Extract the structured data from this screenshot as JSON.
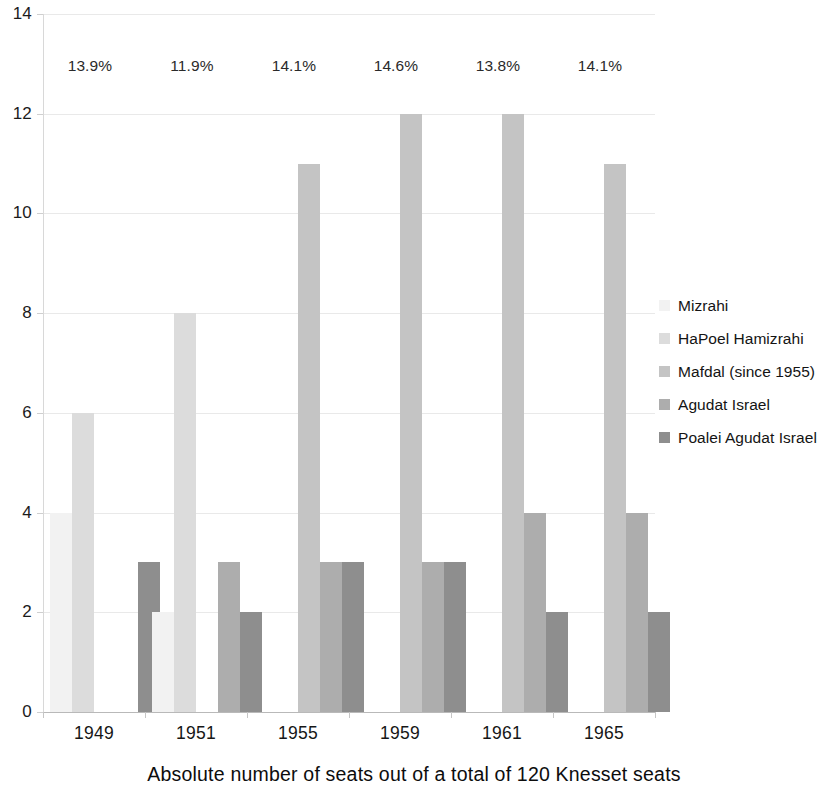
{
  "chart_data": {
    "type": "bar",
    "title": "",
    "subtitle": "",
    "caption": "Absolute number of seats out of a total of 120 Knesset seats",
    "xlabel": "",
    "ylabel": "",
    "ylim": [
      0,
      14
    ],
    "y_ticks": [
      "0",
      "2",
      "4",
      "6",
      "8",
      "10",
      "12",
      "14"
    ],
    "grid": true,
    "legend_position": "right",
    "categories": [
      "1949",
      "1951",
      "1955",
      "1959",
      "1961",
      "1965"
    ],
    "series": [
      {
        "name": "Mizrahi",
        "color": "#f2f2f2",
        "values": [
          4,
          2,
          null,
          null,
          null,
          null
        ]
      },
      {
        "name": "HaPoel Hamizrahi",
        "color": "#dcdcdc",
        "values": [
          6,
          8,
          null,
          null,
          null,
          null
        ]
      },
      {
        "name": "Mafdal (since 1955)",
        "color": "#c4c4c4",
        "values": [
          null,
          null,
          11,
          12,
          12,
          11
        ]
      },
      {
        "name": "Agudat Israel",
        "color": "#adadad",
        "values": [
          null,
          3,
          3,
          3,
          4,
          4
        ]
      },
      {
        "name": "Poalei Agudat Israel",
        "color": "#8e8e8e",
        "values": [
          3,
          2,
          3,
          3,
          2,
          2
        ]
      }
    ],
    "annotations": [
      {
        "category": "1949",
        "text": "13.9%"
      },
      {
        "category": "1951",
        "text": "11.9%"
      },
      {
        "category": "1955",
        "text": "14.1%"
      },
      {
        "category": "1959",
        "text": "14.6%"
      },
      {
        "category": "1961",
        "text": "13.8%"
      },
      {
        "category": "1965",
        "text": "14.1%"
      }
    ]
  }
}
